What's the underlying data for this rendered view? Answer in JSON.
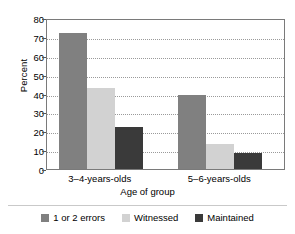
{
  "chart_data": {
    "type": "bar",
    "title": "",
    "xlabel": "Age of group",
    "ylabel": "Percent",
    "categories": [
      "3–4-years-olds",
      "5–6-years-olds"
    ],
    "series": [
      {
        "name": "1 or 2 errors",
        "values": [
          72,
          39
        ],
        "color": "#808080"
      },
      {
        "name": "Witnessed",
        "values": [
          43,
          13
        ],
        "color": "#d2d2d2"
      },
      {
        "name": "Maintained",
        "values": [
          22,
          8.5
        ],
        "color": "#3a3a3a"
      }
    ],
    "ylim": [
      0,
      80
    ],
    "yticks": [
      0,
      10,
      20,
      30,
      40,
      50,
      60,
      70,
      80
    ],
    "ytick_labels": [
      "0",
      "10",
      "20",
      "30",
      "40",
      "50",
      "60",
      "70",
      "80"
    ],
    "grid": true,
    "grid_style": "dotted",
    "legend_position": "bottom",
    "bar_group_gap": true
  },
  "axes": {
    "y_title": "Percent",
    "x_title": "Age of group"
  },
  "legend": {
    "items": [
      {
        "label": "1 or 2 errors",
        "color": "#808080"
      },
      {
        "label": "Witnessed",
        "color": "#d2d2d2"
      },
      {
        "label": "Maintained",
        "color": "#3a3a3a"
      }
    ]
  }
}
